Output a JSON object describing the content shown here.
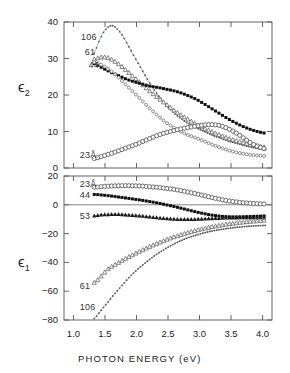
{
  "figure": {
    "xaxis_title": "PHOTON ENERGY (eV)",
    "panel_top_ylabel": "ϵ",
    "panel_top_ysub": "2",
    "panel_bottom_ylabel": "ϵ",
    "panel_bottom_ysub": "1"
  },
  "axes": {
    "x_ticks": [
      "1.0",
      "1.5",
      "2.0",
      "2.5",
      "3.0",
      "3.5",
      "4.0"
    ],
    "top_y_ticks": [
      "40",
      "30",
      "20",
      "10",
      "0"
    ],
    "bottom_y_ticks": [
      "20",
      "0",
      "−20",
      "−40",
      "−60",
      "−80"
    ]
  },
  "annotations": {
    "top": [
      {
        "text": "106",
        "x": 1.12,
        "y": 35.5
      },
      {
        "text": "61",
        "x": 1.18,
        "y": 31.5
      },
      {
        "text": "44",
        "x": 1.24,
        "y": 28.0
      },
      {
        "text": "23Å",
        "x": 1.1,
        "y": 3.2
      }
    ],
    "bottom": [
      {
        "text": "23Å",
        "x": 1.1,
        "y": 14.0
      },
      {
        "text": "44",
        "x": 1.1,
        "y": 6.0
      },
      {
        "text": "53",
        "x": 1.1,
        "y": -8.5
      },
      {
        "text": "61",
        "x": 1.1,
        "y": -57.0
      },
      {
        "text": "106",
        "x": 1.1,
        "y": -72.0
      }
    ]
  },
  "chart_data": [
    {
      "type": "line",
      "panel": "top",
      "title": "",
      "xlabel": "PHOTON ENERGY (eV)",
      "ylabel": "ϵ₂",
      "xlim": [
        0.85,
        4.15
      ],
      "ylim": [
        0,
        40
      ],
      "grid": false,
      "legend": "inline-labels",
      "series": [
        {
          "name": "106",
          "marker": "dot-small",
          "color": "#555555",
          "x": [
            1.33,
            1.4,
            1.47,
            1.55,
            1.62,
            1.7,
            1.78,
            1.86,
            1.95,
            2.05,
            2.15,
            2.25,
            2.36,
            2.47,
            2.58,
            2.7,
            2.82,
            2.95,
            3.08,
            3.2,
            3.33,
            3.45,
            3.58,
            3.7,
            3.82,
            3.94,
            4.06
          ],
          "values": [
            31.5,
            34.5,
            37.0,
            38.6,
            39.0,
            38.0,
            36.2,
            33.8,
            31.0,
            28.0,
            25.0,
            22.2,
            19.6,
            17.3,
            15.3,
            13.6,
            12.2,
            11.0,
            10.0,
            9.0,
            8.2,
            7.4,
            6.8,
            6.2,
            5.7,
            5.3,
            5.0
          ]
        },
        {
          "name": "61",
          "marker": "triangle-open",
          "color": "#6a6a6a",
          "x": [
            1.33,
            1.4,
            1.47,
            1.55,
            1.62,
            1.7,
            1.78,
            1.86,
            1.95,
            2.05,
            2.15,
            2.25,
            2.36,
            2.47,
            2.58,
            2.7,
            2.82,
            2.95,
            3.08,
            3.2,
            3.33,
            3.45,
            3.58,
            3.7,
            3.82,
            3.94,
            4.06
          ],
          "values": [
            29.8,
            30.2,
            30.4,
            30.2,
            29.6,
            28.7,
            27.6,
            26.4,
            25.0,
            23.5,
            22.0,
            20.5,
            19.0,
            17.5,
            16.0,
            14.6,
            13.3,
            12.0,
            10.9,
            9.9,
            9.0,
            8.2,
            7.5,
            6.9,
            6.4,
            6.0,
            5.7
          ]
        },
        {
          "name": "44",
          "marker": "square-filled",
          "color": "#101010",
          "x": [
            1.33,
            1.4,
            1.47,
            1.55,
            1.62,
            1.7,
            1.78,
            1.86,
            1.95,
            2.05,
            2.15,
            2.25,
            2.36,
            2.47,
            2.58,
            2.7,
            2.82,
            2.95,
            3.08,
            3.2,
            3.33,
            3.45,
            3.58,
            3.7,
            3.82,
            3.94,
            4.06
          ],
          "values": [
            28.6,
            28.0,
            27.3,
            26.6,
            26.0,
            25.4,
            24.8,
            24.2,
            23.7,
            23.2,
            22.7,
            22.3,
            22.0,
            21.6,
            21.2,
            20.6,
            19.8,
            18.8,
            17.5,
            16.2,
            14.8,
            13.5,
            12.3,
            11.3,
            10.5,
            9.9,
            9.5
          ]
        },
        {
          "name": "53",
          "marker": "circle-open-small",
          "color": "#666666",
          "x": [
            1.33,
            1.45,
            1.58,
            1.7,
            1.82,
            1.95,
            2.08,
            2.2,
            2.33,
            2.45,
            2.58,
            2.7,
            2.82,
            2.95,
            3.08,
            3.2,
            3.33,
            3.45,
            3.58,
            3.7,
            3.82,
            3.94,
            4.06
          ],
          "values": [
            29.0,
            28.2,
            26.8,
            25.0,
            23.0,
            20.8,
            18.6,
            16.5,
            14.5,
            12.7,
            11.2,
            10.0,
            9.0,
            8.2,
            7.3,
            6.4,
            5.6,
            4.9,
            4.3,
            3.9,
            3.6,
            3.4,
            3.3
          ]
        },
        {
          "name": "23",
          "marker": "circle-open",
          "color": "#4d4d4d",
          "x": [
            1.33,
            1.45,
            1.58,
            1.7,
            1.82,
            1.95,
            2.08,
            2.2,
            2.33,
            2.45,
            2.58,
            2.7,
            2.82,
            2.95,
            3.08,
            3.2,
            3.33,
            3.45,
            3.58,
            3.7,
            3.82,
            3.94,
            4.06
          ],
          "values": [
            2.6,
            3.2,
            3.9,
            4.6,
            5.4,
            6.2,
            7.1,
            8.0,
            8.9,
            9.6,
            10.2,
            10.7,
            11.1,
            11.5,
            11.8,
            11.9,
            11.6,
            10.8,
            9.6,
            8.2,
            6.8,
            5.8,
            5.2
          ]
        }
      ]
    },
    {
      "type": "line",
      "panel": "bottom",
      "title": "",
      "xlabel": "PHOTON ENERGY (eV)",
      "ylabel": "ϵ₁",
      "xlim": [
        0.85,
        4.15
      ],
      "ylim": [
        -80,
        20
      ],
      "grid": false,
      "legend": "inline-labels",
      "series": [
        {
          "name": "23",
          "marker": "circle-open",
          "color": "#4d4d4d",
          "x": [
            1.33,
            1.45,
            1.58,
            1.7,
            1.82,
            1.95,
            2.08,
            2.2,
            2.33,
            2.45,
            2.58,
            2.7,
            2.82,
            2.95,
            3.08,
            3.2,
            3.33,
            3.45,
            3.58,
            3.7,
            3.82,
            3.94,
            4.06
          ],
          "values": [
            12.2,
            12.6,
            13.0,
            13.2,
            13.3,
            13.2,
            13.0,
            12.6,
            12.1,
            11.5,
            10.8,
            9.9,
            8.8,
            7.6,
            6.3,
            5.0,
            3.8,
            2.8,
            2.0,
            1.4,
            1.0,
            0.7,
            0.6
          ]
        },
        {
          "name": "44",
          "marker": "square-filled",
          "color": "#101010",
          "x": [
            1.33,
            1.45,
            1.58,
            1.7,
            1.82,
            1.95,
            2.08,
            2.2,
            2.33,
            2.45,
            2.58,
            2.7,
            2.82,
            2.95,
            3.08,
            3.2,
            3.33,
            3.45,
            3.58,
            3.7,
            3.82,
            3.94,
            4.06
          ],
          "values": [
            7.2,
            6.8,
            6.2,
            5.5,
            4.8,
            4.0,
            3.2,
            2.3,
            1.3,
            0.2,
            -1.0,
            -2.3,
            -3.6,
            -5.0,
            -6.2,
            -7.2,
            -7.9,
            -8.3,
            -8.4,
            -8.3,
            -8.1,
            -7.9,
            -7.7
          ]
        },
        {
          "name": "53",
          "marker": "triangle-filled",
          "color": "#1a1a1a",
          "x": [
            1.33,
            1.45,
            1.58,
            1.7,
            1.82,
            1.95,
            2.08,
            2.2,
            2.33,
            2.45,
            2.58,
            2.7,
            2.82,
            2.95,
            3.08,
            3.2,
            3.33,
            3.45,
            3.58,
            3.7,
            3.82,
            3.94,
            4.06
          ],
          "values": [
            -7.6,
            -6.9,
            -6.6,
            -6.6,
            -6.8,
            -7.2,
            -7.7,
            -8.3,
            -8.9,
            -9.4,
            -9.8,
            -10.0,
            -10.0,
            -9.9,
            -9.7,
            -9.4,
            -9.2,
            -9.0,
            -8.9,
            -8.8,
            -8.8,
            -8.8,
            -8.9
          ]
        },
        {
          "name": "61",
          "marker": "triangle-open",
          "color": "#6a6a6a",
          "x": [
            1.33,
            1.4,
            1.47,
            1.55,
            1.62,
            1.7,
            1.78,
            1.86,
            1.95,
            2.05,
            2.15,
            2.25,
            2.36,
            2.47,
            2.58,
            2.7,
            2.82,
            2.95,
            3.08,
            3.2,
            3.33,
            3.45,
            3.58,
            3.7,
            3.82,
            3.94,
            4.06
          ],
          "values": [
            -54.0,
            -51.5,
            -48.0,
            -44.5,
            -42.5,
            -40.5,
            -38.5,
            -36.5,
            -34.5,
            -32.3,
            -30.2,
            -28.2,
            -26.2,
            -24.3,
            -22.5,
            -20.8,
            -19.2,
            -17.7,
            -16.4,
            -15.2,
            -14.2,
            -13.3,
            -12.6,
            -12.0,
            -11.5,
            -11.1,
            -10.8
          ]
        },
        {
          "name": "106",
          "marker": "dot-small",
          "color": "#555555",
          "x": [
            1.33,
            1.4,
            1.47,
            1.55,
            1.62,
            1.7,
            1.78,
            1.86,
            1.95,
            2.05,
            2.15,
            2.25,
            2.36,
            2.47,
            2.58,
            2.7,
            2.82,
            2.95,
            3.08,
            3.2,
            3.33,
            3.45,
            3.58,
            3.7,
            3.82,
            3.94,
            4.06
          ],
          "values": [
            -79.0,
            -75.5,
            -71.5,
            -67.5,
            -63.5,
            -59.5,
            -55.5,
            -51.5,
            -47.5,
            -43.5,
            -40.0,
            -36.5,
            -33.2,
            -30.2,
            -27.5,
            -25.0,
            -22.8,
            -21.0,
            -19.4,
            -18.2,
            -17.2,
            -16.4,
            -15.7,
            -15.2,
            -14.8,
            -14.5,
            -14.3
          ]
        }
      ]
    }
  ]
}
